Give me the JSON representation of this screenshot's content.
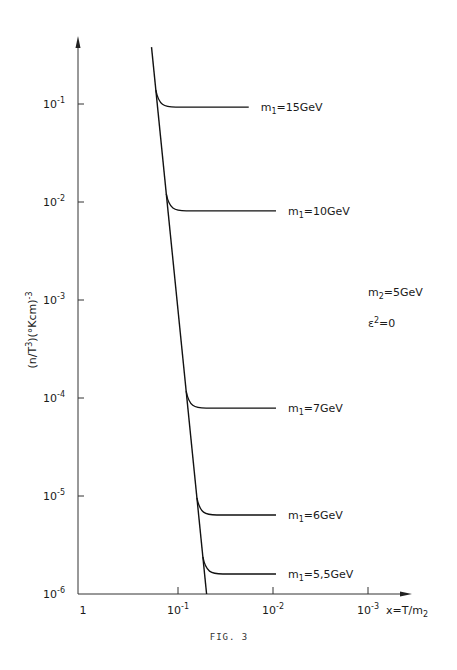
{
  "chart_data": {
    "type": "line",
    "title": "",
    "caption": "FIG. 3",
    "xlabel": "x=T/m2",
    "ylabel": "(n/T3)(°Kcm)-3",
    "xscale": "log",
    "yscale": "log",
    "x_reversed": true,
    "xlim": [
      1,
      0.0005
    ],
    "ylim": [
      1e-06,
      0.5
    ],
    "grid": false,
    "x_ticks": [
      {
        "value": 1,
        "base": "1",
        "exp": ""
      },
      {
        "value": 0.1,
        "base": "10",
        "exp": "-1"
      },
      {
        "value": 0.01,
        "base": "10",
        "exp": "-2"
      },
      {
        "value": 0.001,
        "base": "10",
        "exp": "-3"
      }
    ],
    "y_ticks": [
      {
        "value": 0.1,
        "base": "10",
        "exp": "-1"
      },
      {
        "value": 0.01,
        "base": "10",
        "exp": "-2"
      },
      {
        "value": 0.001,
        "base": "10",
        "exp": "-3"
      },
      {
        "value": 0.0001,
        "base": "10",
        "exp": "-4"
      },
      {
        "value": 1e-05,
        "base": "10",
        "exp": "-5"
      },
      {
        "value": 1e-06,
        "base": "10",
        "exp": "-6"
      }
    ],
    "annotations": [
      {
        "text": "m2=5GeV",
        "main": "m",
        "sub": "2",
        "rest": "=5GeV"
      },
      {
        "text": "ε2=0",
        "main": "ε",
        "sup": "2",
        "rest": "=0"
      }
    ],
    "equilibrium_line": {
      "name": "equilibrium",
      "points": [
        [
          0.19,
          0.38
        ],
        [
          0.05,
          1e-06
        ]
      ]
    },
    "series": [
      {
        "name": "m1=15GeV",
        "sub": "1",
        "rest": "=15GeV",
        "branch_x": 0.135,
        "plateau": 0.093,
        "x_end": 0.018
      },
      {
        "name": "m1=10GeV",
        "sub": "1",
        "rest": "=10GeV",
        "branch_x": 0.11,
        "plateau": 0.0081,
        "x_end": 0.0093
      },
      {
        "name": "m1=7GeV",
        "sub": "1",
        "rest": "=7GeV",
        "branch_x": 0.08,
        "plateau": 7.9e-05,
        "x_end": 0.0093
      },
      {
        "name": "m1=6GeV",
        "sub": "1",
        "rest": "=6GeV",
        "branch_x": 0.063,
        "plateau": 6.4e-06,
        "x_end": 0.0093
      },
      {
        "name": "m1=5,5GeV",
        "sub": "1",
        "rest": "=5,5GeV",
        "branch_x": 0.056,
        "plateau": 1.6e-06,
        "x_end": 0.0093
      }
    ]
  },
  "axes": {
    "ylabel_parts": {
      "a": "(n/T",
      "a_sup": "3",
      "b": ")(°Kcm)",
      "b_sup": "-3"
    },
    "xlabel_parts": {
      "a": "x=T/m",
      "a_sub": "2"
    }
  },
  "caption": "FIG. 3"
}
